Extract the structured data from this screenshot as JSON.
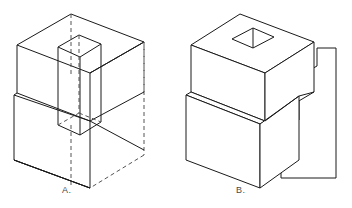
{
  "figure_set": {
    "title": "Isometric object views",
    "background_color": "#ffffff",
    "line_color": "#1a1a1a",
    "hidden_line_color": "#555555",
    "label_color": "#4a4a4a"
  },
  "figures": [
    {
      "id": "A",
      "label": "A.",
      "description": "Wireframe isometric of stepped block with vertical square through-prism, hidden edges dashed",
      "style": "wireframe",
      "has_hidden_lines": true
    },
    {
      "id": "B",
      "label": "B.",
      "description": "Solid isometric of stepped block with square hole in top face and separate stepped cutting plane at right",
      "style": "solid",
      "has_hidden_lines": false
    }
  ]
}
